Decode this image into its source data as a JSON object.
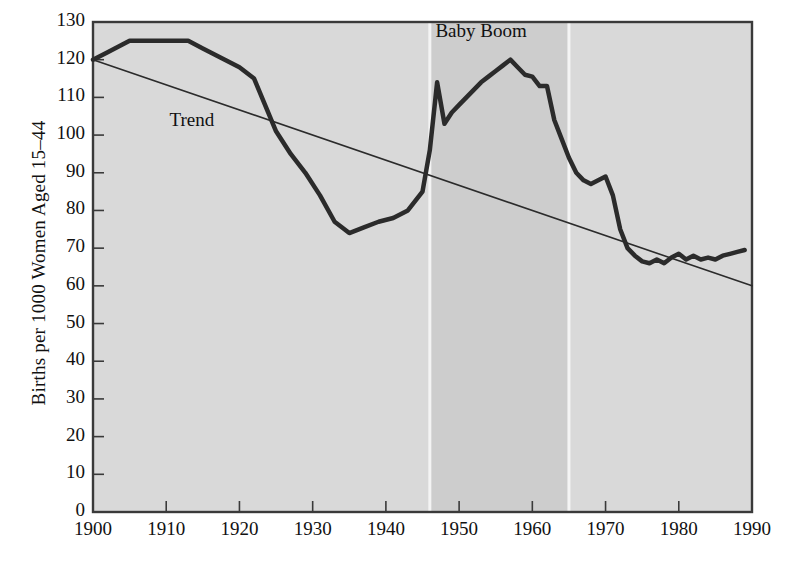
{
  "chart_data": {
    "type": "line",
    "title": "",
    "xlabel": "",
    "ylabel": "Births per 1000 Women Aged 15–44",
    "xlim": [
      1900,
      1990
    ],
    "ylim": [
      0,
      130
    ],
    "grid": false,
    "legend_position": "none",
    "xticks": [
      1900,
      1910,
      1920,
      1930,
      1940,
      1950,
      1960,
      1970,
      1980,
      1990
    ],
    "yticks": [
      0,
      10,
      20,
      30,
      40,
      50,
      60,
      70,
      80,
      90,
      100,
      110,
      120,
      130
    ],
    "xtick_labels": [
      "1900",
      "1910",
      "1920",
      "1930",
      "1940",
      "1950",
      "1960",
      "1970",
      "1980",
      "1990"
    ],
    "ytick_labels": [
      "0",
      "10",
      "20",
      "30",
      "40",
      "50",
      "60",
      "70",
      "80",
      "90",
      "100",
      "110",
      "120",
      "130"
    ],
    "annotations": [
      {
        "text": "Baby Boom",
        "x": 1953.0,
        "y": 127.0
      },
      {
        "text": "Trend",
        "x": 1913.5,
        "y": 103.5
      }
    ],
    "shaded_regions": [
      {
        "label": "Baby Boom",
        "x_start": 1946,
        "x_end": 1965,
        "color": "#cdcdcd",
        "edge_color": "#f4f4f4"
      }
    ],
    "series": [
      {
        "name": "Birth rate",
        "color": "#2b2b2b",
        "linewidth": 4.5,
        "x": [
          1900,
          1902,
          1905,
          1908,
          1911,
          1913,
          1915,
          1918,
          1920,
          1922,
          1925,
          1927,
          1929,
          1931,
          1933,
          1935,
          1937,
          1939,
          1941,
          1943,
          1945,
          1946,
          1947,
          1948,
          1949,
          1950,
          1951,
          1952,
          1953,
          1954,
          1955,
          1956,
          1957,
          1958,
          1959,
          1960,
          1961,
          1962,
          1963,
          1964,
          1965,
          1966,
          1967,
          1968,
          1969,
          1970,
          1971,
          1972,
          1973,
          1974,
          1975,
          1976,
          1977,
          1978,
          1979,
          1980,
          1981,
          1982,
          1983,
          1984,
          1985,
          1986,
          1987,
          1988,
          1989
        ],
        "y": [
          120,
          122,
          125,
          125,
          125,
          125,
          123,
          120,
          118,
          115,
          101,
          95,
          90,
          84,
          77,
          74,
          75.5,
          77,
          78,
          80,
          85,
          96,
          114,
          103,
          106,
          108,
          110,
          112,
          114,
          115.5,
          117,
          118.5,
          120,
          118,
          116,
          115.5,
          113,
          113,
          104,
          99,
          94,
          90,
          88,
          87,
          88,
          89,
          84,
          75,
          70,
          68,
          66.5,
          66,
          67,
          66,
          67.5,
          68.5,
          67,
          68,
          67,
          67.5,
          67,
          68,
          68.5,
          69,
          69.5
        ]
      },
      {
        "name": "Trend",
        "color": "#2b2b2b",
        "linewidth": 1.6,
        "x": [
          1900,
          1990
        ],
        "y": [
          120,
          60
        ]
      }
    ]
  },
  "figure": {
    "plot_bg": "#d9d9d9",
    "band_bg": "#cdcdcd",
    "band_edge": "#f4f4f4",
    "frame_color": "#3a3a3a",
    "page_bg": "#ffffff"
  }
}
